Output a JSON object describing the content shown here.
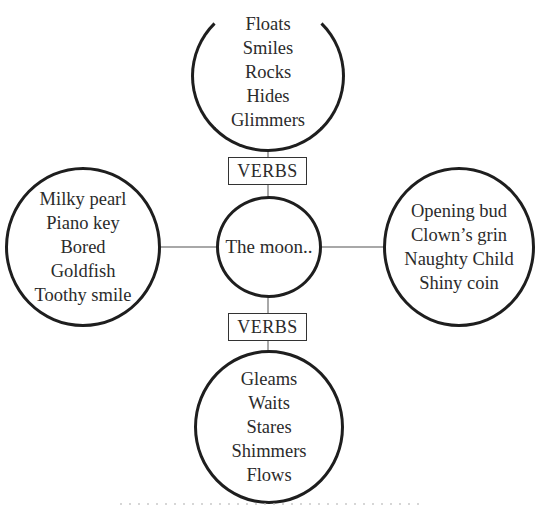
{
  "diagram": {
    "type": "word-web",
    "center": {
      "label": "The moon.."
    },
    "top": {
      "connector_label": "VERBS",
      "words": [
        "Floats",
        "Smiles",
        "Rocks",
        "Hides",
        "Glimmers"
      ]
    },
    "left": {
      "words": [
        "Milky pearl",
        "Piano key",
        "Bored",
        "Goldfish",
        "Toothy smile"
      ]
    },
    "right": {
      "words": [
        "Opening bud",
        "Clown’s grin",
        "Naughty Child",
        "Shiny coin"
      ]
    },
    "bottom": {
      "connector_label": "VERBS",
      "words": [
        "Gleams",
        "Waits",
        "Stares",
        "Shimmers",
        "Flows"
      ]
    },
    "colors": {
      "circle_border": "#1e1e1e",
      "connector_line": "#a8a8a8",
      "text": "#2b2b2b",
      "background": "#ffffff"
    }
  }
}
